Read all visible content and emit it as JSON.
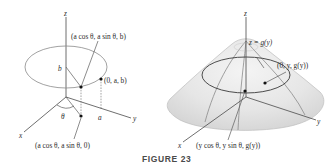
{
  "figure": {
    "caption": "FIGURE 23",
    "left_panel": {
      "axis_labels": {
        "x": "x",
        "y": "y",
        "z": "z"
      },
      "point_top_label": "(a cos θ, a sin θ, b)",
      "point_right_label": "(0, a, b)",
      "point_bottom_label": "(a cos θ, a sin θ, 0)",
      "height_label": "b",
      "radius_label": "a",
      "angle_label": "θ"
    },
    "right_panel": {
      "axis_labels": {
        "x": "x",
        "y": "y",
        "z": "z"
      },
      "surface_label": "z = g(y)",
      "point_right_label": "(0, y, g(y))",
      "point_bottom_label": "(y cos θ, y sin θ, g(y))"
    }
  }
}
